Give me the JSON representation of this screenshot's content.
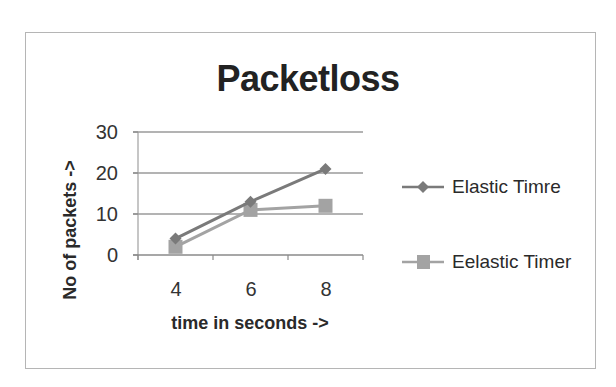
{
  "chart": {
    "title": "Packetloss",
    "xlabel": "time in seconds ->",
    "ylabel": "No of packets ->",
    "y_ticks": [
      "30",
      "20",
      "10",
      "0"
    ],
    "x_ticks": [
      "4",
      "6",
      "8"
    ],
    "legend": [
      {
        "label": "Elastic Timre",
        "marker": "diamond",
        "color": "#7a7a7a"
      },
      {
        "label": "Eelastic Timer",
        "marker": "square",
        "color": "#a3a3a3"
      }
    ]
  },
  "chart_data": {
    "type": "line",
    "title": "Packetloss",
    "xlabel": "time in seconds ->",
    "ylabel": "No of packets ->",
    "categories": [
      "4",
      "6",
      "8"
    ],
    "series": [
      {
        "name": "Elastic Timre",
        "values": [
          4,
          13,
          21
        ],
        "marker": "diamond",
        "color": "#7a7a7a"
      },
      {
        "name": "Eelastic Timer",
        "values": [
          2,
          11,
          12
        ],
        "marker": "square",
        "color": "#a3a3a3"
      }
    ],
    "ylim": [
      0,
      30
    ],
    "y_ticks": [
      0,
      10,
      20,
      30
    ],
    "grid": {
      "horizontal": true,
      "vertical": false
    },
    "legend_position": "right"
  }
}
